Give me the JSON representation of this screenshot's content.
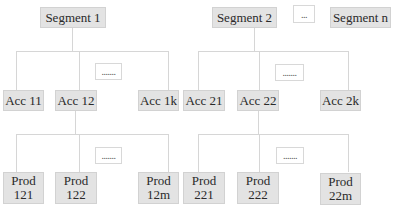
{
  "segments": [
    {
      "label": "Segment 1"
    },
    {
      "label": "Segment 2"
    },
    {
      "label": "..."
    },
    {
      "label": "Segment n"
    }
  ],
  "accounts": {
    "segment1": [
      {
        "label": "Acc 11"
      },
      {
        "label": "Acc 12"
      },
      {
        "label": "Acc 1k"
      }
    ],
    "segment2": [
      {
        "label": "Acc 21"
      },
      {
        "label": "Acc 22"
      },
      {
        "label": "Acc 2k"
      }
    ],
    "ellipsis": "......."
  },
  "products": {
    "acc12": [
      {
        "line1": "Prod",
        "line2": "121"
      },
      {
        "line1": "Prod",
        "line2": "122"
      },
      {
        "line1": "Prod",
        "line2": "12m"
      }
    ],
    "acc22": [
      {
        "line1": "Prod",
        "line2": "221"
      },
      {
        "line1": "Prod",
        "line2": "222"
      },
      {
        "line1": "Prod",
        "line2": "22m"
      }
    ],
    "ellipsis": "......."
  },
  "colors": {
    "box_fill": "#e3e3e3",
    "line": "#d6d6d6",
    "background": "#ffffff"
  }
}
